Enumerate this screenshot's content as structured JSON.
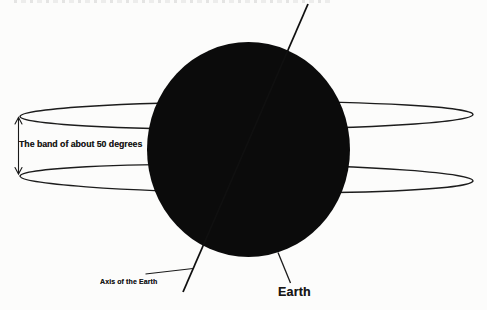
{
  "page": {
    "background_color": "#fcfcfb",
    "ink_color": "#141414"
  },
  "diagram": {
    "labels": {
      "band": "The band of about 50 degrees",
      "axis": "Axis of the Earth",
      "earth": "Earth"
    }
  }
}
